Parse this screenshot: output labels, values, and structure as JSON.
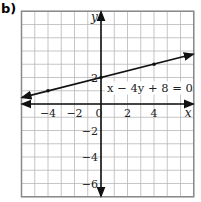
{
  "part_label": "b)",
  "chart_data": {
    "type": "line",
    "title": "",
    "xlabel": "x",
    "ylabel": "y",
    "xlim": [
      -6,
      7
    ],
    "ylim": [
      -7,
      7
    ],
    "grid": true,
    "x_ticks": [
      -4,
      -2,
      0,
      2,
      4
    ],
    "x_tick_labels": [
      "−4",
      "−2",
      "0",
      "2",
      "4"
    ],
    "y_ticks": [
      2,
      -2,
      -4,
      -6
    ],
    "y_tick_labels": [
      "2",
      "−2",
      "−4",
      "−6"
    ],
    "series": [
      {
        "name": "x − 4y + 8 = 0",
        "equation": "x - 4y + 8 = 0",
        "slope": 0.25,
        "intercept": 2,
        "x": [
          -6,
          7
        ],
        "y": [
          0.5,
          3.75
        ],
        "marked_points": [
          [
            -4,
            1
          ],
          [
            0,
            2
          ],
          [
            4,
            3
          ]
        ],
        "arrows": "both ends"
      }
    ],
    "annotations": [
      {
        "text": "x − 4y + 8 = 0",
        "x": 0.3,
        "y": 1.2
      }
    ]
  },
  "labels": {
    "x_axis": "x",
    "y_axis": "y",
    "equation": "x − 4y + 8 = 0",
    "x_ticks": [
      "−4",
      "−2",
      "0",
      "2",
      "4"
    ],
    "y_ticks": [
      "2",
      "−2",
      "−4",
      "−6"
    ]
  },
  "colors": {
    "grid": "#b8b8b8",
    "frame": "#8a8a8a",
    "axes": "#111111",
    "line": "#111111"
  }
}
